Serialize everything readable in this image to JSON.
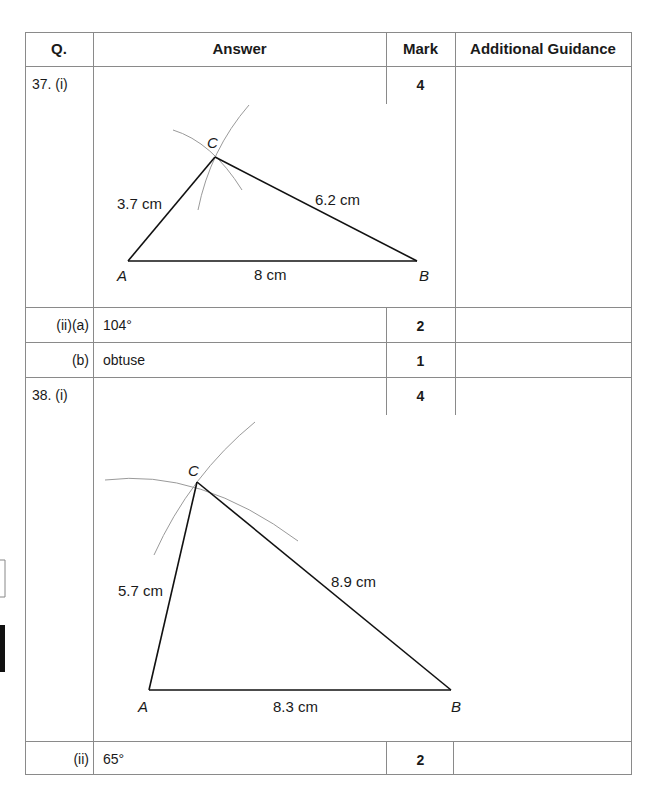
{
  "table": {
    "headers": {
      "q": "Q.",
      "answer": "Answer",
      "mark": "Mark",
      "guidance": "Additional Guidance"
    },
    "rows": [
      {
        "q": "37. (i)",
        "answer": "",
        "mark": "4",
        "guidance": ""
      },
      {
        "q": "(ii)(a)",
        "answer": "104°",
        "mark": "2",
        "guidance": ""
      },
      {
        "q": "(b)",
        "answer": "obtuse",
        "mark": "1",
        "guidance": ""
      },
      {
        "q": "38. (i)",
        "answer": "",
        "mark": "4",
        "guidance": ""
      },
      {
        "q": "(ii)",
        "answer": "65°",
        "mark": "2",
        "guidance": ""
      }
    ]
  },
  "diagrams": {
    "q37": {
      "vertices": {
        "A": "A",
        "B": "B",
        "C": "C"
      },
      "sides": {
        "AC": "3.7 cm",
        "CB": "6.2 cm",
        "AB": "8 cm"
      }
    },
    "q38": {
      "vertices": {
        "A": "A",
        "B": "B",
        "C": "C"
      },
      "sides": {
        "AC": "5.7 cm",
        "CB": "8.9 cm",
        "AB": "8.3 cm"
      }
    }
  }
}
